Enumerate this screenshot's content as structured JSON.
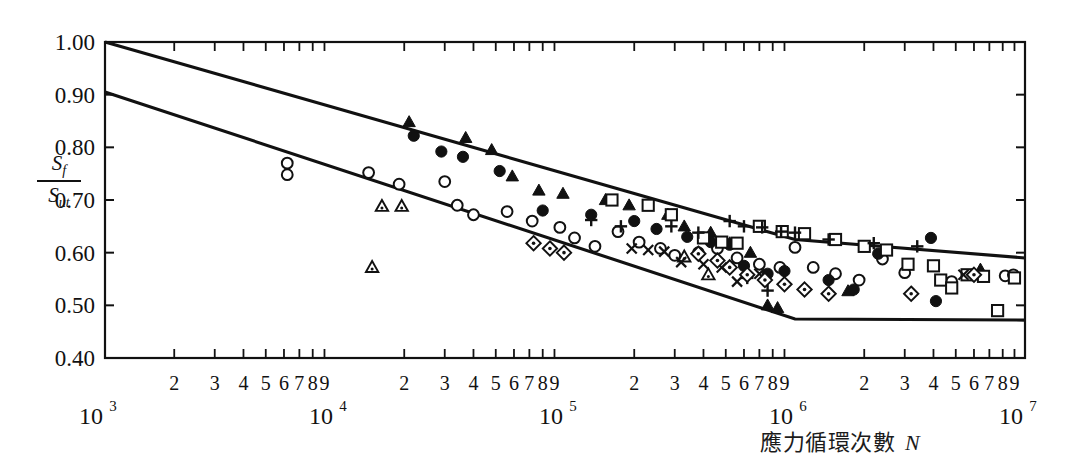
{
  "figure": {
    "kind": "S-N fatigue band chart",
    "background": "#ffffff",
    "ink": "#111111"
  },
  "axes": {
    "y_label_numerator": "S",
    "y_label_numerator_sub": "f",
    "y_label_denominator": "S",
    "y_label_denominator_sub": "ut",
    "x_title": "應力循環次數",
    "x_title_var": "N",
    "y_ticks": [
      "1.00",
      "0.90",
      "0.80",
      "0.70",
      "0.60",
      "0.50",
      "0.40"
    ],
    "x_decades": [
      "10",
      "10",
      "10",
      "10",
      "10"
    ],
    "x_decade_exponents": [
      "3",
      "4",
      "5",
      "6",
      "7"
    ],
    "x_minor_labels": [
      "2",
      "3",
      "4",
      "5",
      "6",
      "7",
      "8",
      "9"
    ]
  },
  "chart_data": {
    "type": "scatter",
    "title": "",
    "xlabel": "應力循環次數 N",
    "ylabel": "Sf / Sut",
    "xscale": "log",
    "xlim": [
      1000,
      10000000
    ],
    "ylim": [
      0.4,
      1.0
    ],
    "grid": false,
    "legend": "none",
    "axis_ticks_y": [
      0.4,
      0.5,
      0.6,
      0.7,
      0.8,
      0.9,
      1.0
    ],
    "axis_ticks_x_decades": [
      1000,
      10000,
      100000,
      1000000,
      10000000
    ],
    "bands": [
      {
        "name": "upper-bound",
        "points": [
          [
            1000,
            1.0
          ],
          [
            1000000,
            0.625
          ],
          [
            10000000,
            0.59
          ]
        ]
      },
      {
        "name": "lower-bound",
        "points": [
          [
            1000,
            0.905
          ],
          [
            1000000,
            0.474
          ],
          [
            10000000,
            0.472
          ]
        ]
      }
    ],
    "series": [
      {
        "name": "filled-triangle",
        "marker": "triangle-filled",
        "points": [
          [
            21000,
            0.848
          ],
          [
            37000,
            0.818
          ],
          [
            48000,
            0.795
          ],
          [
            59000,
            0.745
          ],
          [
            77000,
            0.718
          ],
          [
            98000,
            0.712
          ],
          [
            150000,
            0.7
          ],
          [
            190000,
            0.69
          ],
          [
            280000,
            0.672
          ],
          [
            330000,
            0.65
          ],
          [
            430000,
            0.638
          ],
          [
            520000,
            0.618
          ],
          [
            640000,
            0.6
          ],
          [
            760000,
            0.5
          ],
          [
            840000,
            0.495
          ],
          [
            1700000,
            0.527
          ],
          [
            6400000,
            0.568
          ]
        ]
      },
      {
        "name": "open-circle",
        "marker": "circle-open",
        "points": [
          [
            6200,
            0.77
          ],
          [
            6200,
            0.748
          ],
          [
            14000,
            0.752
          ],
          [
            19000,
            0.73
          ],
          [
            30000,
            0.735
          ],
          [
            34000,
            0.69
          ],
          [
            40000,
            0.672
          ],
          [
            56000,
            0.678
          ],
          [
            72000,
            0.66
          ],
          [
            95000,
            0.648
          ],
          [
            110000,
            0.628
          ],
          [
            135000,
            0.612
          ],
          [
            170000,
            0.64
          ],
          [
            210000,
            0.62
          ],
          [
            260000,
            0.608
          ],
          [
            300000,
            0.595
          ],
          [
            380000,
            0.6
          ],
          [
            460000,
            0.608
          ],
          [
            560000,
            0.59
          ],
          [
            700000,
            0.578
          ],
          [
            860000,
            0.572
          ],
          [
            1000000,
            0.61
          ],
          [
            1200000,
            0.572
          ],
          [
            1500000,
            0.56
          ],
          [
            1900000,
            0.548
          ],
          [
            2400000,
            0.588
          ],
          [
            3000000,
            0.562
          ],
          [
            4800000,
            0.545
          ],
          [
            8200000,
            0.556
          ],
          [
            8900000,
            0.558
          ]
        ]
      },
      {
        "name": "filled-circle",
        "marker": "circle-filled",
        "points": [
          [
            22000,
            0.822
          ],
          [
            29000,
            0.792
          ],
          [
            36000,
            0.782
          ],
          [
            52000,
            0.755
          ],
          [
            80000,
            0.68
          ],
          [
            130000,
            0.672
          ],
          [
            200000,
            0.66
          ],
          [
            250000,
            0.645
          ],
          [
            340000,
            0.63
          ],
          [
            430000,
            0.62
          ],
          [
            520000,
            0.615
          ],
          [
            600000,
            0.575
          ],
          [
            760000,
            0.56
          ],
          [
            900000,
            0.565
          ],
          [
            1400000,
            0.548
          ],
          [
            1800000,
            0.53
          ],
          [
            2300000,
            0.598
          ],
          [
            3900000,
            0.628
          ],
          [
            4100000,
            0.508
          ]
        ]
      },
      {
        "name": "open-triangle",
        "marker": "triangle-open",
        "points": [
          [
            16000,
            0.688
          ],
          [
            19500,
            0.688
          ],
          [
            14500,
            0.572
          ],
          [
            330000,
            0.592
          ],
          [
            420000,
            0.558
          ]
        ]
      },
      {
        "name": "open-square",
        "marker": "square-open",
        "points": [
          [
            160000,
            0.7
          ],
          [
            230000,
            0.69
          ],
          [
            290000,
            0.672
          ],
          [
            400000,
            0.628
          ],
          [
            480000,
            0.62
          ],
          [
            560000,
            0.618
          ],
          [
            700000,
            0.65
          ],
          [
            880000,
            0.64
          ],
          [
            1100000,
            0.636
          ],
          [
            1500000,
            0.625
          ],
          [
            2000000,
            0.612
          ],
          [
            2500000,
            0.605
          ],
          [
            3100000,
            0.578
          ],
          [
            4000000,
            0.575
          ],
          [
            4300000,
            0.548
          ],
          [
            4800000,
            0.533
          ],
          [
            5600000,
            0.558
          ],
          [
            6600000,
            0.555
          ],
          [
            7600000,
            0.49
          ],
          [
            9000000,
            0.552
          ]
        ]
      },
      {
        "name": "plus",
        "marker": "plus",
        "points": [
          [
            130000,
            0.662
          ],
          [
            175000,
            0.65
          ],
          [
            290000,
            0.65
          ],
          [
            380000,
            0.638
          ],
          [
            520000,
            0.66
          ],
          [
            600000,
            0.65
          ],
          [
            720000,
            0.648
          ],
          [
            870000,
            0.64
          ],
          [
            1000000,
            0.638
          ],
          [
            1400000,
            0.625
          ],
          [
            2200000,
            0.618
          ],
          [
            3400000,
            0.612
          ],
          [
            620000,
            0.552
          ],
          [
            760000,
            0.528
          ]
        ]
      },
      {
        "name": "x-cross",
        "marker": "x",
        "points": [
          [
            195000,
            0.608
          ],
          [
            230000,
            0.605
          ],
          [
            270000,
            0.602
          ],
          [
            320000,
            0.582
          ],
          [
            400000,
            0.578
          ],
          [
            480000,
            0.572
          ],
          [
            560000,
            0.545
          ],
          [
            700000,
            0.56
          ],
          [
            5400000,
            0.558
          ]
        ]
      },
      {
        "name": "dotted-diamond",
        "marker": "diamond-dot",
        "points": [
          [
            73000,
            0.618
          ],
          [
            86000,
            0.608
          ],
          [
            99000,
            0.6
          ],
          [
            380000,
            0.598
          ],
          [
            460000,
            0.585
          ],
          [
            520000,
            0.572
          ],
          [
            620000,
            0.558
          ],
          [
            740000,
            0.548
          ],
          [
            900000,
            0.54
          ],
          [
            1100000,
            0.53
          ],
          [
            1400000,
            0.522
          ],
          [
            3200000,
            0.522
          ],
          [
            6000000,
            0.558
          ]
        ]
      }
    ]
  }
}
